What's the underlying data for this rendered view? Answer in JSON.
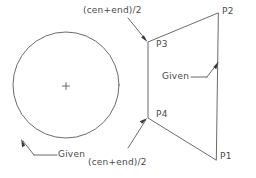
{
  "figure": {
    "type": "cad-construction-diagram",
    "background_color": "#ffffff",
    "stroke_color": "#5a5a5a",
    "text_color": "#4a4a4a",
    "width": 256,
    "height": 178
  },
  "shapes": {
    "circle": {
      "name": "given-circle",
      "cx": 66,
      "cy": 85,
      "r": 53,
      "center_mark": {
        "cx": 66,
        "cy": 86,
        "size": 7
      }
    },
    "quad": {
      "name": "given-quadrilateral",
      "points": "218,13 148,42 148,118 216,160",
      "vertices": [
        {
          "id": "P2",
          "x": 218,
          "y": 13
        },
        {
          "id": "P3",
          "x": 148,
          "y": 42
        },
        {
          "id": "P4",
          "x": 148,
          "y": 118
        },
        {
          "id": "P1",
          "x": 216,
          "y": 160
        }
      ]
    }
  },
  "labels": {
    "p1": {
      "text": "P1",
      "x": 220,
      "y": 153
    },
    "p2": {
      "text": "P2",
      "x": 222,
      "y": 7
    },
    "p3": {
      "text": "P3",
      "x": 156,
      "y": 42
    },
    "p4": {
      "text": "P4",
      "x": 156,
      "y": 111
    },
    "midpoint_top": {
      "text": "(cen+end)/2",
      "x": 83,
      "y": 6
    },
    "midpoint_bottom": {
      "text": "(cen+end)/2",
      "x": 88,
      "y": 158
    },
    "given_circle": {
      "text": "Given",
      "x": 36,
      "y": 158
    },
    "given_quad": {
      "text": "Given",
      "x": 162,
      "y": 74
    }
  },
  "leaders": {
    "midpoint_top_leader": {
      "name": "leader-to-p3",
      "path": "M 128,18 L 146,40",
      "arrow_at": {
        "x": 146,
        "y": 40,
        "angle": 50
      }
    },
    "midpoint_bottom_leader": {
      "name": "leader-to-p4",
      "path": "M 128,148 L 146,120",
      "arrow_at": {
        "x": 146,
        "y": 120,
        "angle": -57
      }
    },
    "given_circle_leader": {
      "name": "leader-to-circle",
      "path": "M 34,155 L 22,140 M 34,155 L 58,155",
      "arrow_at": {
        "x": 22,
        "y": 140,
        "angle": -128
      }
    },
    "given_quad_leader": {
      "name": "leader-to-quad-edge",
      "path": "M 191,77 L 208,77 L 218,62",
      "arrow_at": {
        "x": 218,
        "y": 62,
        "angle": -56
      }
    }
  }
}
